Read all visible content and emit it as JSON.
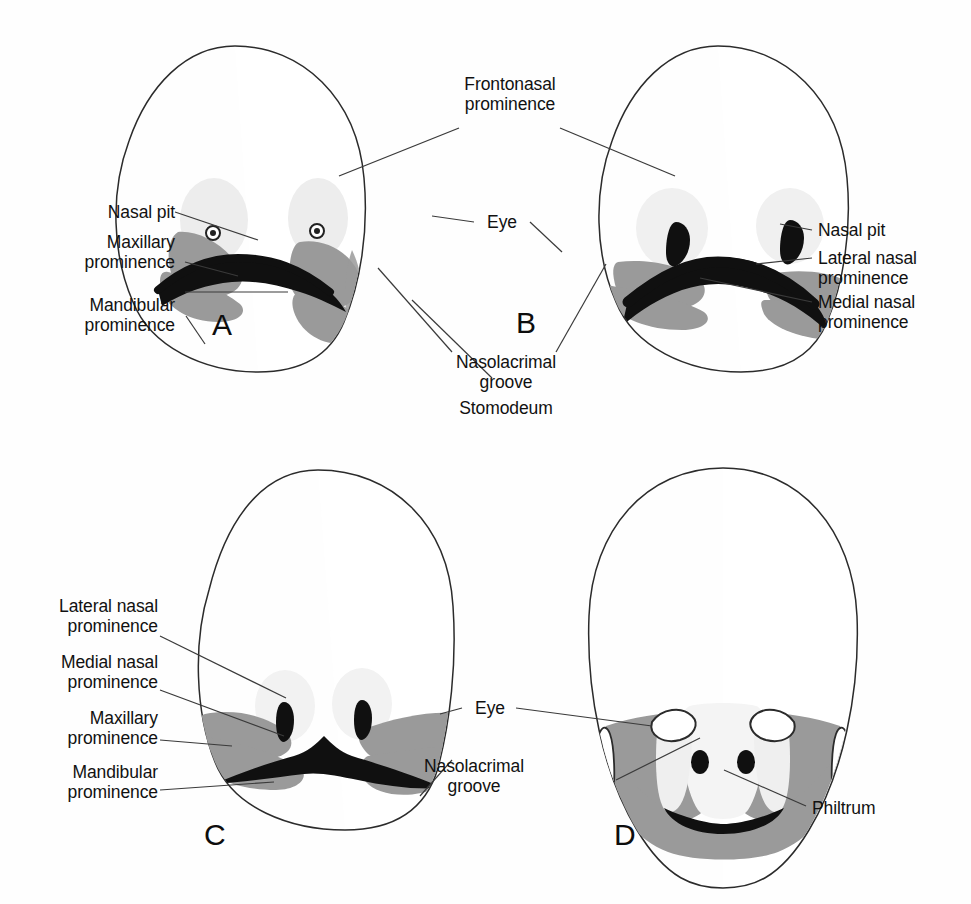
{
  "figure": {
    "panel_count": 4,
    "colors": {
      "outline": "#2b2b2b",
      "mid_gray": "#9a9a9a",
      "light_gray": "#ededed",
      "pale_gray": "#f2f2f2",
      "black_fill": "#101010",
      "leader_line": "#3a3a3a",
      "background": "#fefefe"
    }
  },
  "panels": [
    {
      "letter": "A"
    },
    {
      "letter": "B"
    },
    {
      "letter": "C"
    },
    {
      "letter": "D"
    }
  ],
  "labels": {
    "frontonasal_prominence": "Frontonasal\nprominence",
    "nasal_pit_a": "Nasal pit",
    "maxillary_prominence_a": "Maxillary\nprominence",
    "mandibular_prominence_a": "Mandibular\nprominence",
    "eye_top": "Eye",
    "nasal_pit_b": "Nasal pit",
    "lateral_nasal_prominence_b": "Lateral nasal\nprominence",
    "medial_nasal_prominence_b": "Medial nasal\nprominence",
    "nasolacrimal_groove_top": "Nasolacrimal\ngroove",
    "stomodeum": "Stomodeum",
    "lateral_nasal_prominence_c": "Lateral nasal\nprominence",
    "medial_nasal_prominence_c": "Medial nasal\nprominence",
    "maxillary_prominence_c": "Maxillary\nprominence",
    "mandibular_prominence_c": "Mandibular\nprominence",
    "eye_bottom": "Eye",
    "nasolacrimal_groove_bottom": "Nasolacrimal\ngroove",
    "philtrum": "Philtrum"
  }
}
